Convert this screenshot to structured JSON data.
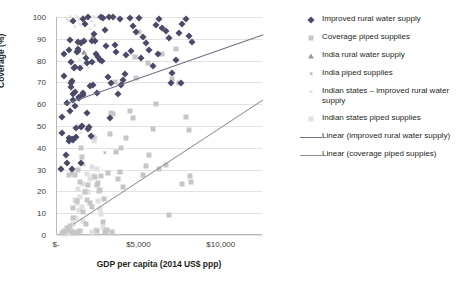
{
  "chart_data": {
    "type": "scatter",
    "title": "",
    "xlabel": "GDP per capita (2014 US$ ppp)",
    "ylabel": "Coverage (%)",
    "xlim": [
      0,
      12500
    ],
    "ylim": [
      0,
      100
    ],
    "grid": true,
    "legend_position": "right",
    "xticks": [
      {
        "value": 0,
        "label": "$-"
      },
      {
        "value": 5000,
        "label": "$5,000"
      },
      {
        "value": 10000,
        "label": "$10,000"
      }
    ],
    "yticks": [
      {
        "value": 0,
        "label": "0"
      },
      {
        "value": 10,
        "label": "10"
      },
      {
        "value": 20,
        "label": "20"
      },
      {
        "value": 30,
        "label": "30"
      },
      {
        "value": 40,
        "label": "40"
      },
      {
        "value": 50,
        "label": "50"
      },
      {
        "value": 60,
        "label": "60"
      },
      {
        "value": 70,
        "label": "70"
      },
      {
        "value": 80,
        "label": "80"
      },
      {
        "value": 90,
        "label": "90"
      },
      {
        "value": 100,
        "label": "100"
      }
    ],
    "series": [
      {
        "name": "Improved rural water supply",
        "marker": "diamond",
        "color": "#4a4a68",
        "points": [
          [
            250,
            30.5
          ],
          [
            300,
            47.0
          ],
          [
            330,
            54.0
          ],
          [
            420,
            73.0
          ],
          [
            450,
            83.0
          ],
          [
            520,
            36.5
          ],
          [
            600,
            33.0
          ],
          [
            620,
            60.5
          ],
          [
            700,
            43.0
          ],
          [
            740,
            44.5
          ],
          [
            760,
            57.0
          ],
          [
            800,
            89.5
          ],
          [
            830,
            69.5
          ],
          [
            860,
            68.0
          ],
          [
            880,
            70.5
          ],
          [
            900,
            44.0
          ],
          [
            930,
            30.5
          ],
          [
            960,
            62.0
          ],
          [
            980,
            64.5
          ],
          [
            1000,
            43.5
          ],
          [
            1050,
            76.5
          ],
          [
            1080,
            77.0
          ],
          [
            1100,
            59.0
          ],
          [
            1150,
            45.0
          ],
          [
            1180,
            49.0
          ],
          [
            1220,
            84.0
          ],
          [
            1250,
            88.5
          ],
          [
            1280,
            85.5
          ],
          [
            1300,
            84.5
          ],
          [
            1320,
            63.0
          ],
          [
            1350,
            63.5
          ],
          [
            1400,
            76.5
          ],
          [
            1450,
            33.0
          ],
          [
            1480,
            49.5
          ],
          [
            1520,
            50.0
          ],
          [
            1560,
            65.0
          ],
          [
            1600,
            64.0
          ],
          [
            1650,
            89.0
          ],
          [
            1700,
            97.0
          ],
          [
            1750,
            81.0
          ],
          [
            1800,
            79.0
          ],
          [
            1850,
            56.0
          ],
          [
            1900,
            48.5
          ],
          [
            1950,
            49.5
          ],
          [
            2000,
            68.5
          ],
          [
            2100,
            79.5
          ],
          [
            2200,
            69.0
          ],
          [
            2300,
            89.0
          ],
          [
            2350,
            83.0
          ],
          [
            2400,
            65.0
          ],
          [
            2500,
            81.5
          ],
          [
            2600,
            80.5
          ],
          [
            2700,
            100.0
          ],
          [
            2800,
            99.5
          ],
          [
            2900,
            94.0
          ],
          [
            3000,
            86.5
          ],
          [
            3100,
            72.5
          ],
          [
            3200,
            53.5
          ],
          [
            3300,
            69.5
          ],
          [
            3400,
            100.0
          ],
          [
            3500,
            87.0
          ],
          [
            3600,
            84.0
          ],
          [
            3700,
            64.5
          ],
          [
            3800,
            99.0
          ],
          [
            3900,
            69.0
          ],
          [
            4000,
            71.0
          ],
          [
            4200,
            82.5
          ],
          [
            4400,
            99.5
          ],
          [
            4600,
            96.0
          ],
          [
            4800,
            93.0
          ],
          [
            5000,
            99.5
          ],
          [
            5200,
            91.0
          ],
          [
            5400,
            88.0
          ],
          [
            5600,
            85.0
          ],
          [
            5800,
            77.5
          ],
          [
            6000,
            96.5
          ],
          [
            6200,
            99.0
          ],
          [
            6400,
            95.0
          ],
          [
            6600,
            93.5
          ],
          [
            6800,
            90.5
          ],
          [
            7000,
            74.5
          ],
          [
            7200,
            80.5
          ],
          [
            7400,
            92.5
          ],
          [
            7600,
            97.0
          ],
          [
            7800,
            99.0
          ],
          [
            8000,
            91.5
          ],
          [
            8200,
            88.5
          ],
          [
            700,
            85.0
          ],
          [
            1480,
            88.0
          ],
          [
            2150,
            89.0
          ],
          [
            860,
            79.5
          ],
          [
            1120,
            65.5
          ],
          [
            2050,
            45.5
          ],
          [
            3150,
            100.0
          ],
          [
            2750,
            80.0
          ],
          [
            1900,
            100.0
          ],
          [
            2250,
            92.0
          ],
          [
            980,
            98.0
          ],
          [
            1600,
            99.0
          ],
          [
            4100,
            74.0
          ],
          [
            4500,
            84.5
          ],
          [
            5100,
            81.0
          ],
          [
            6100,
            83.0
          ],
          [
            6900,
            69.5
          ],
          [
            7500,
            69.5
          ]
        ]
      },
      {
        "name": "Coverage piped supplies",
        "marker": "square",
        "color": "#c6c6c6",
        "points": [
          [
            300,
            1.0
          ],
          [
            400,
            2.0
          ],
          [
            500,
            1.5
          ],
          [
            600,
            3.0
          ],
          [
            700,
            27.5
          ],
          [
            800,
            4.0
          ],
          [
            900,
            28.5
          ],
          [
            950,
            8.0
          ],
          [
            1000,
            12.5
          ],
          [
            1100,
            27.5
          ],
          [
            1200,
            15.5
          ],
          [
            1300,
            30.0
          ],
          [
            1400,
            24.5
          ],
          [
            1450,
            40.0
          ],
          [
            1500,
            36.0
          ],
          [
            1600,
            10.5
          ],
          [
            1700,
            19.5
          ],
          [
            1800,
            16.0
          ],
          [
            1900,
            23.0
          ],
          [
            2000,
            14.5
          ],
          [
            2100,
            13.0
          ],
          [
            2200,
            45.0
          ],
          [
            2300,
            26.5
          ],
          [
            2400,
            23.0
          ],
          [
            2500,
            24.0
          ],
          [
            2600,
            20.5
          ],
          [
            2700,
            27.0
          ],
          [
            2800,
            6.0
          ],
          [
            2900,
            1.5
          ],
          [
            3000,
            2.0
          ],
          [
            3100,
            28.5
          ],
          [
            3200,
            46.5
          ],
          [
            3300,
            56.0
          ],
          [
            3400,
            55.5
          ],
          [
            3500,
            70.0
          ],
          [
            3600,
            38.0
          ],
          [
            3700,
            25.5
          ],
          [
            3800,
            29.0
          ],
          [
            3900,
            40.0
          ],
          [
            4000,
            22.0
          ],
          [
            4200,
            44.5
          ],
          [
            4400,
            57.0
          ],
          [
            4600,
            53.5
          ],
          [
            4800,
            72.0
          ],
          [
            5000,
            93.0
          ],
          [
            5200,
            27.5
          ],
          [
            5400,
            31.5
          ],
          [
            5600,
            36.5
          ],
          [
            5800,
            48.5
          ],
          [
            6000,
            60.0
          ],
          [
            6200,
            30.5
          ],
          [
            6400,
            83.0
          ],
          [
            6600,
            32.0
          ],
          [
            6800,
            9.0
          ],
          [
            7000,
            71.5
          ],
          [
            7200,
            85.5
          ],
          [
            7400,
            69.5
          ],
          [
            7600,
            23.5
          ],
          [
            7800,
            54.0
          ],
          [
            8000,
            48.0
          ],
          [
            2550,
            20.0
          ],
          [
            1250,
            1.5
          ],
          [
            1050,
            1.0
          ],
          [
            650,
            2.5
          ],
          [
            1750,
            5.0
          ],
          [
            3050,
            2.5
          ],
          [
            3350,
            1.5
          ],
          [
            2850,
            16.5
          ],
          [
            4750,
            81.5
          ],
          [
            5500,
            79.0
          ],
          [
            900,
            1.5
          ],
          [
            1380,
            2.0
          ],
          [
            2450,
            2.0
          ],
          [
            8100,
            27.0
          ],
          [
            8150,
            24.5
          ]
        ]
      },
      {
        "name": "India rural water supply",
        "marker": "triangle",
        "color": "#9a9a9a",
        "points": [
          [
            1620,
            84.0
          ],
          [
            2200,
            91.5
          ]
        ]
      },
      {
        "name": "India piped supplies",
        "marker": "x",
        "color": "#8e8e8e",
        "points": [
          [
            1620,
            32.0
          ],
          [
            2900,
            37.5
          ]
        ]
      },
      {
        "name": "Indian states - improved rural water supply",
        "marker": "x-light",
        "color": "#d2d2d2",
        "points": [
          [
            600,
            99.0
          ],
          [
            700,
            98.0
          ],
          [
            800,
            100.0
          ],
          [
            900,
            97.5
          ],
          [
            1000,
            99.0
          ],
          [
            1100,
            95.5
          ],
          [
            1200,
            100.0
          ],
          [
            1300,
            98.5
          ],
          [
            1400,
            96.5
          ],
          [
            1500,
            99.5
          ],
          [
            1600,
            100.0
          ],
          [
            1700,
            97.0
          ],
          [
            1800,
            99.0
          ],
          [
            1900,
            100.0
          ],
          [
            2000,
            94.5
          ],
          [
            2100,
            98.0
          ],
          [
            2200,
            100.0
          ],
          [
            2300,
            96.0
          ],
          [
            2400,
            99.5
          ],
          [
            2500,
            100.0
          ],
          [
            1350,
            80.5
          ],
          [
            1550,
            78.0
          ],
          [
            1750,
            82.0
          ],
          [
            1900,
            76.5
          ],
          [
            2050,
            79.0
          ],
          [
            1250,
            50.5
          ],
          [
            1450,
            47.0
          ]
        ]
      },
      {
        "name": "Indian states piped supplies",
        "marker": "square-light",
        "color": "#e0e0e0",
        "points": [
          [
            1100,
            16.0
          ],
          [
            1200,
            14.5
          ],
          [
            1300,
            21.0
          ],
          [
            1400,
            17.5
          ],
          [
            1500,
            13.0
          ],
          [
            1600,
            23.5
          ],
          [
            1700,
            20.0
          ],
          [
            1800,
            28.0
          ],
          [
            1900,
            19.5
          ],
          [
            2000,
            25.5
          ],
          [
            2100,
            31.0
          ],
          [
            2200,
            27.0
          ],
          [
            2300,
            44.5
          ],
          [
            2400,
            30.5
          ],
          [
            2500,
            15.5
          ],
          [
            2600,
            12.0
          ],
          [
            2700,
            9.5
          ],
          [
            2800,
            3.5
          ],
          [
            1000,
            5.0
          ],
          [
            1150,
            8.0
          ],
          [
            900,
            2.0
          ],
          [
            1350,
            11.5
          ],
          [
            1550,
            6.5
          ],
          [
            2150,
            1.5
          ],
          [
            2350,
            2.5
          ],
          [
            700,
            1.0
          ],
          [
            800,
            1.5
          ],
          [
            500,
            0.5
          ],
          [
            600,
            1.0
          ],
          [
            2250,
            43.0
          ]
        ]
      }
    ],
    "trendlines": [
      {
        "name": "Linear (improved rural water supply)",
        "color": "#6e6e86",
        "x0": 400,
        "y0": 60.0,
        "x1": 12500,
        "y1": 92.0
      },
      {
        "name": "Linear (coverage piped suppies)",
        "color": "#8d8d8d",
        "x0": 1000,
        "y0": 5.0,
        "x1": 12500,
        "y1": 62.0
      }
    ]
  },
  "legend": {
    "items": [
      {
        "label": "Improved rural water supply",
        "marker": "diamond"
      },
      {
        "label": "Coverage piped supplies",
        "marker": "square"
      },
      {
        "label": "India rural water supply",
        "marker": "triangle"
      },
      {
        "label": "India piped supplies",
        "marker": "x"
      },
      {
        "label": "Indian states – improved rural water supply",
        "marker": "x-light"
      },
      {
        "label": "Indian states piped supplies",
        "marker": "square-light"
      },
      {
        "label": "Linear (improved rural water supply)",
        "marker": "line"
      },
      {
        "label": "Linear (coverage piped suppies)",
        "marker": "line-light"
      }
    ]
  }
}
